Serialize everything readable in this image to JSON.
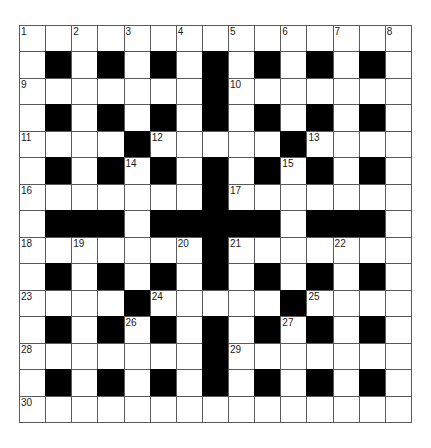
{
  "puzzle": {
    "rows": 15,
    "cols": 15,
    "colors": {
      "block": "#000000",
      "cell": "#ffffff",
      "gridline": "#5a5a5a",
      "number": "#1a1a1a"
    },
    "layout": [
      "...............",
      ".#.#.#.#.#.#.#.",
      ".......#.......",
      ".#.#.#.#.#.#.#.",
      "....#.....#....",
      ".#.#.#.#.#.#.#.",
      ".......#.......",
      ".###.#####.###.",
      ".......#.......",
      ".#.#.#.#.#.#.#.",
      "....#.....#....",
      ".#.#.#.#.#.#.#.",
      ".......#.......",
      ".#.#.#.#.#.#.#.",
      "..............."
    ],
    "numbers": [
      {
        "n": "1",
        "r": 0,
        "c": 0
      },
      {
        "n": "2",
        "r": 0,
        "c": 2
      },
      {
        "n": "3",
        "r": 0,
        "c": 4
      },
      {
        "n": "4",
        "r": 0,
        "c": 6
      },
      {
        "n": "5",
        "r": 0,
        "c": 8
      },
      {
        "n": "6",
        "r": 0,
        "c": 10
      },
      {
        "n": "7",
        "r": 0,
        "c": 12
      },
      {
        "n": "8",
        "r": 0,
        "c": 14
      },
      {
        "n": "9",
        "r": 2,
        "c": 0
      },
      {
        "n": "10",
        "r": 2,
        "c": 8
      },
      {
        "n": "11",
        "r": 4,
        "c": 0
      },
      {
        "n": "12",
        "r": 4,
        "c": 5
      },
      {
        "n": "13",
        "r": 4,
        "c": 11
      },
      {
        "n": "14",
        "r": 5,
        "c": 4
      },
      {
        "n": "15",
        "r": 5,
        "c": 10
      },
      {
        "n": "16",
        "r": 6,
        "c": 0
      },
      {
        "n": "17",
        "r": 6,
        "c": 8
      },
      {
        "n": "18",
        "r": 8,
        "c": 0
      },
      {
        "n": "19",
        "r": 8,
        "c": 2
      },
      {
        "n": "20",
        "r": 8,
        "c": 6
      },
      {
        "n": "21",
        "r": 8,
        "c": 8
      },
      {
        "n": "22",
        "r": 8,
        "c": 12
      },
      {
        "n": "23",
        "r": 10,
        "c": 0
      },
      {
        "n": "24",
        "r": 10,
        "c": 5
      },
      {
        "n": "25",
        "r": 10,
        "c": 11
      },
      {
        "n": "26",
        "r": 11,
        "c": 4
      },
      {
        "n": "27",
        "r": 11,
        "c": 10
      },
      {
        "n": "28",
        "r": 12,
        "c": 0
      },
      {
        "n": "29",
        "r": 12,
        "c": 8
      },
      {
        "n": "30",
        "r": 14,
        "c": 0
      }
    ]
  }
}
